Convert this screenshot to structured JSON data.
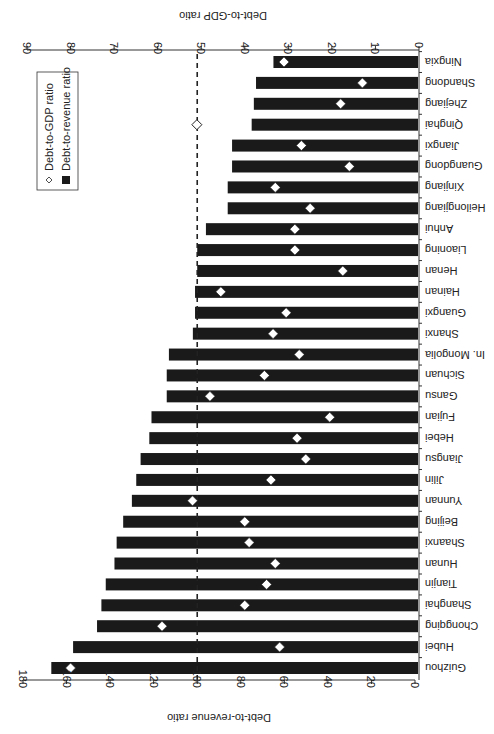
{
  "chart_data": {
    "type": "bar",
    "orientation": "horizontal",
    "rotation_deg": 180,
    "title": "",
    "categories": [
      "Guizhou",
      "Hubei",
      "Chongqing",
      "Shanghai",
      "Tianjin",
      "Hunan",
      "Shaanxi",
      "Beijing",
      "Yunnan",
      "Jilin",
      "Jiangsu",
      "Hebei",
      "Fujian",
      "Gansu",
      "Sichuan",
      "In. Mongolia",
      "Shanxi",
      "Guangxi",
      "Hainan",
      "Henan",
      "Liaoning",
      "Anhui",
      "Heilongjiang",
      "Xinjiang",
      "Guangdong",
      "Jiangxi",
      "Qinghai",
      "Zhejiang",
      "Shandong",
      "Ningxia"
    ],
    "series": [
      {
        "name": "Debt-to-revenue ratio",
        "marker": "black-bar",
        "axis": "primary",
        "values": [
          167,
          157,
          146,
          144,
          142,
          138,
          137,
          134,
          130,
          128,
          126,
          122,
          121,
          114,
          114,
          113,
          102,
          101,
          101,
          100,
          100,
          96,
          86,
          86,
          84,
          84,
          75,
          74,
          73,
          65
        ]
      },
      {
        "name": "Debt-to-GDP ratio",
        "marker": "diamond",
        "axis": "secondary",
        "values": [
          80,
          32,
          59,
          40,
          35,
          33,
          39,
          40,
          52,
          34,
          26,
          28,
          20.5,
          48,
          35.5,
          27.5,
          33.5,
          30.5,
          45.5,
          17.5,
          28.5,
          28.5,
          25,
          33,
          16,
          27,
          51,
          18,
          13,
          31
        ]
      }
    ],
    "xlabel": "Debt-to-revenue ratio",
    "x2label": "Debt-to-GDP ratio",
    "xlim": [
      0,
      180
    ],
    "x2lim": [
      0,
      90
    ],
    "xticks": [
      0,
      20,
      40,
      60,
      80,
      100,
      120,
      140,
      160,
      180
    ],
    "x2ticks": [
      0,
      10,
      20,
      30,
      40,
      50,
      60,
      70,
      80,
      90
    ],
    "reference_line": {
      "value_primary": 100,
      "value_secondary": 50,
      "style": "dashed"
    },
    "grid": false,
    "legend_position": "upper-right (in unrotated frame)"
  },
  "legend": {
    "items": [
      {
        "label": "Debt-to-revenue ratio",
        "symbol": "filled-square"
      },
      {
        "label": "Debt-to-GDP ratio",
        "symbol": "hollow-diamond"
      }
    ]
  },
  "colors": {
    "bar": "#1a1a1a",
    "diamond_fill": "#ffffff",
    "axis": "#333333",
    "reference_line": "#222222"
  }
}
